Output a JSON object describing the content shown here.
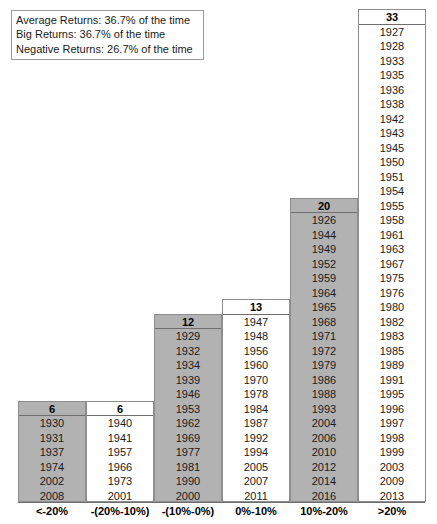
{
  "legend": {
    "lines": [
      "Average Returns: 36.7% of the time",
      "Big Returns: 36.7% of the time",
      "Negative Returns: 26.7% of the time"
    ]
  },
  "colors": {
    "shaded_column": "#b2b2b2",
    "plain_column": "#ffffff",
    "border": "#8d8d8d",
    "text": "#1a1a1a"
  },
  "chart_data": {
    "type": "bar",
    "title": "",
    "subtitle": "",
    "xlabel": "",
    "ylabel": "",
    "grid": false,
    "legend_position": "top-left",
    "annotations": [
      "Average Returns: 36.7% of the time",
      "Big Returns: 36.7% of the time",
      "Negative Returns: 26.7% of the time"
    ],
    "categories": [
      "<-20%",
      "-(20%-10%)",
      "-(10%-0%)",
      "0%-10%",
      "10%-20%",
      ">20%"
    ],
    "values": [
      6,
      6,
      12,
      13,
      20,
      33
    ],
    "ylim": [
      0,
      33
    ],
    "note": "Histogram of annual returns by bucket; each stacked cell is one year.",
    "bins": [
      {
        "label": "<-20%",
        "count": 6,
        "shaded": true,
        "years": [
          "1930",
          "1931",
          "1937",
          "1974",
          "2002",
          "2008"
        ]
      },
      {
        "label": "-(20%-10%)",
        "count": 6,
        "shaded": false,
        "years": [
          "1940",
          "1941",
          "1957",
          "1966",
          "1973",
          "2001"
        ]
      },
      {
        "label": "-(10%-0%)",
        "count": 12,
        "shaded": true,
        "years": [
          "1929",
          "1932",
          "1934",
          "1939",
          "1946",
          "1953",
          "1962",
          "1969",
          "1977",
          "1981",
          "1990",
          "2000"
        ]
      },
      {
        "label": "0%-10%",
        "count": 13,
        "shaded": false,
        "years": [
          "1947",
          "1948",
          "1956",
          "1960",
          "1970",
          "1978",
          "1984",
          "1987",
          "1992",
          "1994",
          "2005",
          "2007",
          "2011"
        ]
      },
      {
        "label": "10%-20%",
        "count": 20,
        "shaded": true,
        "years": [
          "1926",
          "1944",
          "1949",
          "1952",
          "1959",
          "1964",
          "1965",
          "1968",
          "1971",
          "1972",
          "1979",
          "1986",
          "1988",
          "1993",
          "2004",
          "2006",
          "2010",
          "2012",
          "2014",
          "2016"
        ]
      },
      {
        "label": ">20%",
        "count": 33,
        "shaded": false,
        "years": [
          "1927",
          "1928",
          "1933",
          "1935",
          "1936",
          "1938",
          "1942",
          "1943",
          "1945",
          "1950",
          "1951",
          "1954",
          "1955",
          "1958",
          "1961",
          "1963",
          "1967",
          "1975",
          "1976",
          "1980",
          "1982",
          "1983",
          "1985",
          "1989",
          "1991",
          "1995",
          "1996",
          "1997",
          "1998",
          "1999",
          "2003",
          "2009",
          "2013"
        ]
      }
    ]
  }
}
